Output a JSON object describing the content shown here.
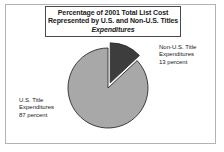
{
  "figure": {
    "title_lines": [
      "Percentage of 2001 Total List Cost",
      "Represented by U.S. and Non-U.S. Titles",
      "Expenditures"
    ]
  },
  "labels": {
    "non_us": {
      "line1": "Non-U.S. Title",
      "line2": "Expenditures",
      "line3": "13 percent"
    },
    "us": {
      "line1": "U.S. Title",
      "line2": "Expenditures",
      "line3": "87 percent"
    }
  },
  "colors": {
    "us_slice": "#a8a8a8",
    "non_us_slice": "#3d3d3d",
    "slice_outline": "#2b2b2b",
    "frame": "#b3b3b3",
    "title_border": "#4a4a4a",
    "text": "#1a1a1a",
    "background": "#ffffff"
  },
  "chart_data": {
    "type": "pie",
    "title": "Percentage of 2001 Total List Cost Represented by U.S. and Non-U.S. Titles Expenditures",
    "subtitle": "Expenditures",
    "xlabel": "",
    "ylabel": "",
    "grid": false,
    "legend_position": "callout-labels",
    "units": "percent",
    "start_angle_deg": 0,
    "direction": "clockwise",
    "categories": [
      "Non-U.S. Title Expenditures",
      "U.S. Title Expenditures"
    ],
    "values": [
      13,
      87
    ],
    "slices": [
      {
        "label": "Non-U.S. Title Expenditures",
        "value": 13,
        "value_text": "13 percent",
        "color": "#3d3d3d",
        "exploded": true
      },
      {
        "label": "U.S. Title Expenditures",
        "value": 87,
        "value_text": "87 percent",
        "color": "#a8a8a8",
        "exploded": false
      }
    ]
  }
}
